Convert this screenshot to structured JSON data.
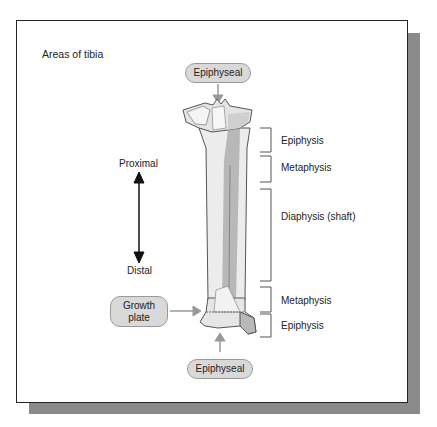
{
  "diagram": {
    "title": "Areas of tibia",
    "direction": {
      "top_label": "Proximal",
      "bottom_label": "Distal"
    },
    "callouts": {
      "top": "Epiphyseal",
      "bottom": "Epiphyseal",
      "growth_plate_line1": "Growth",
      "growth_plate_line2": "plate"
    },
    "regions": [
      {
        "label": "Epiphysis"
      },
      {
        "label": "Metaphysis"
      },
      {
        "label": "Diaphysis (shaft)"
      },
      {
        "label": "Metaphysis"
      },
      {
        "label": "Epiphysis"
      }
    ],
    "colors": {
      "callout_fill": "#d9d9d9",
      "callout_border": "#9a9a9a",
      "bone_light": "#ececec",
      "bone_shade": "#b8b8b8",
      "shadow": "#8a8a8a"
    }
  }
}
